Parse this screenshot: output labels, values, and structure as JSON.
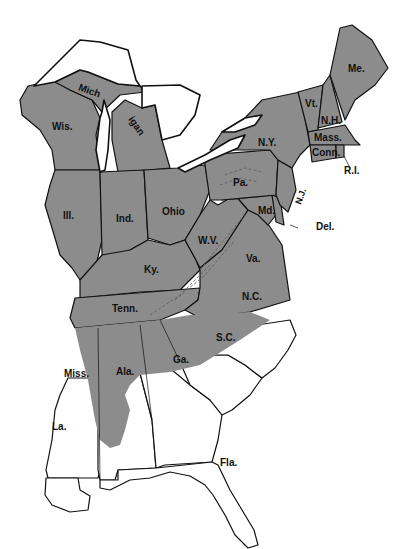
{
  "map": {
    "type": "choropleth",
    "region": "Eastern United States",
    "shade_color": "#8c8c8c",
    "unshaded_color": "#ffffff",
    "border_color": "#111111",
    "shaded_states": [
      "Wis.",
      "Mich.",
      "Ill.",
      "Ind.",
      "Ohio",
      "Ky.",
      "Tenn.",
      "W.V.",
      "Va.",
      "Md.",
      "Pa.",
      "N.Y.",
      "N.J.",
      "Del.",
      "Vt.",
      "N.H.",
      "Me.",
      "Mass.",
      "Conn.",
      "R.I."
    ],
    "partially_shaded_states": [
      "Ala.",
      "N.C.",
      "Ga."
    ],
    "unshaded_states": [
      "Miss.",
      "La.",
      "S.C.",
      "Fla."
    ],
    "labels": {
      "wis": "Wis.",
      "mich_upper": "Mich",
      "mich_lower": "igan",
      "ill": "Ill.",
      "ind": "Ind.",
      "ohio": "Ohio",
      "ky": "Ky.",
      "tenn": "Tenn.",
      "wv": "W.V.",
      "va": "Va.",
      "md": "Md.",
      "pa": "Pa.",
      "ny": "N.Y.",
      "nj": "N.J.",
      "del": "Del.",
      "vt": "Vt.",
      "nh": "N.H.",
      "me": "Me.",
      "mass": "Mass.",
      "conn": "Conn.",
      "ri": "R.I.",
      "nc": "N.C.",
      "sc": "S.C.",
      "ga": "Ga.",
      "ala": "Ala.",
      "miss": "Miss.",
      "la": "La.",
      "fla": "Fla."
    }
  }
}
